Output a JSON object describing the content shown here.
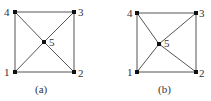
{
  "figures": [
    {
      "caption": "(a)",
      "nodes": [
        {
          "id": "1",
          "x": 15,
          "y": 72,
          "lx": 4,
          "ly": 76
        },
        {
          "id": "2",
          "x": 74,
          "y": 72,
          "lx": 78,
          "ly": 77
        },
        {
          "id": "3",
          "x": 74,
          "y": 12,
          "lx": 78,
          "ly": 16
        },
        {
          "id": "4",
          "x": 15,
          "y": 12,
          "lx": 4,
          "ly": 16
        },
        {
          "id": "5",
          "x": 44,
          "y": 42,
          "lx": 49,
          "ly": 46
        }
      ],
      "edges": [
        [
          "1",
          "2"
        ],
        [
          "2",
          "3"
        ],
        [
          "3",
          "4"
        ],
        [
          "4",
          "1"
        ],
        [
          "1",
          "5"
        ],
        [
          "5",
          "3"
        ],
        [
          "4",
          "5"
        ],
        [
          "5",
          "2"
        ]
      ],
      "caption_pos": {
        "x": 35,
        "y": 93
      }
    },
    {
      "caption": "(b)",
      "nodes": [
        {
          "id": "1",
          "x": 137,
          "y": 72,
          "lx": 127,
          "ly": 76
        },
        {
          "id": "2",
          "x": 196,
          "y": 72,
          "lx": 199,
          "ly": 77
        },
        {
          "id": "3",
          "x": 196,
          "y": 13,
          "lx": 199,
          "ly": 17
        },
        {
          "id": "4",
          "x": 137,
          "y": 13,
          "lx": 127,
          "ly": 17
        },
        {
          "id": "5",
          "x": 159,
          "y": 44,
          "lx": 164,
          "ly": 47
        }
      ],
      "edges": [
        [
          "1",
          "2"
        ],
        [
          "2",
          "3"
        ],
        [
          "3",
          "4"
        ],
        [
          "4",
          "1"
        ],
        [
          "1",
          "5"
        ],
        [
          "5",
          "3"
        ],
        [
          "4",
          "5"
        ],
        [
          "5",
          "2"
        ]
      ],
      "caption_pos": {
        "x": 158,
        "y": 93
      }
    }
  ]
}
